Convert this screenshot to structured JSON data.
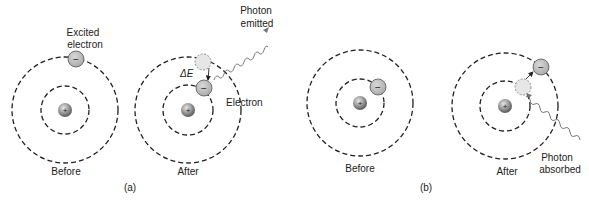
{
  "figure": {
    "panel_a": {
      "tag": "(a)",
      "before": {
        "caption": "Before",
        "callout_line1": "Excited",
        "callout_line2": "electron",
        "electron_symbol": "−",
        "nucleus_symbol": "+"
      },
      "after": {
        "caption": "After",
        "photon_line1": "Photon",
        "photon_line2": "emitted",
        "delta_e": "ΔE",
        "electron_label": "Electron",
        "electron_symbol": "−",
        "nucleus_symbol": "+"
      }
    },
    "panel_b": {
      "tag": "(b)",
      "before": {
        "caption": "Before",
        "electron_symbol": "−",
        "nucleus_symbol": "+"
      },
      "after": {
        "caption": "After",
        "photon_line1": "Photon",
        "photon_line2": "absorbed",
        "electron_symbol": "−",
        "nucleus_symbol": "+"
      }
    },
    "colors": {
      "orbit": "#222222",
      "electron_fill": "#b8b8b8",
      "ghost_fill": "#e6e6e6",
      "nucleus_fill": "#8a8a8a",
      "wave": "#777777"
    }
  }
}
